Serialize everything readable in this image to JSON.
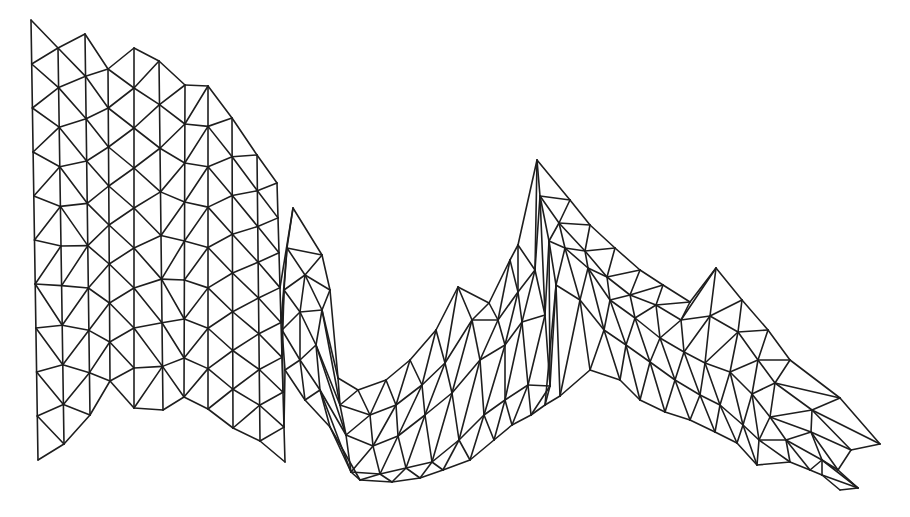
{
  "diagram": {
    "type": "triangular-finite-element-mesh",
    "background": "#ffffff",
    "line_color": "#1e1e1e",
    "left_block": {
      "description": "Regular staggered triangulated grid, vertical node columns",
      "columns": [
        {
          "x_top": 31,
          "x_bot": 38,
          "y_top": 20,
          "y_bot": 460,
          "n": 11,
          "offset": 0
        },
        {
          "x_top": 58,
          "x_bot": 64,
          "y_top": 48,
          "y_bot": 444,
          "n": 11,
          "offset": 0.5
        },
        {
          "x_top": 85,
          "x_bot": 90,
          "y_top": 34,
          "y_bot": 415,
          "n": 10,
          "offset": 0
        },
        {
          "x_top": 108,
          "x_bot": 110,
          "y_top": 69,
          "y_bot": 381,
          "n": 9,
          "offset": 0.5
        },
        {
          "x_top": 134,
          "x_bot": 134,
          "y_top": 48,
          "y_bot": 408,
          "n": 10,
          "offset": 0
        },
        {
          "x_top": 159,
          "x_bot": 163,
          "y_top": 61,
          "y_bot": 410,
          "n": 9,
          "offset": 0.5
        },
        {
          "x_top": 185,
          "x_bot": 184,
          "y_top": 85,
          "y_bot": 397,
          "n": 9,
          "offset": 0
        },
        {
          "x_top": 208,
          "x_bot": 208,
          "y_top": 86,
          "y_bot": 409,
          "n": 9,
          "offset": 0.5
        },
        {
          "x_top": 232,
          "x_bot": 233,
          "y_top": 118,
          "y_bot": 428,
          "n": 9,
          "offset": 0
        },
        {
          "x_top": 257,
          "x_bot": 260,
          "y_top": 155,
          "y_bot": 441,
          "n": 9,
          "offset": 0.5
        },
        {
          "x_top": 277,
          "x_bot": 285,
          "y_top": 183,
          "y_bot": 462,
          "n": 9,
          "offset": 0
        }
      ]
    },
    "channel_rows": {
      "description": "Curvilinear triangulated strip rows along the channel (top boundary to bottom boundary)",
      "rows": [
        [
          [
            293,
            208
          ],
          [
            322,
            255
          ],
          [
            330,
            290
          ],
          [
            338,
            378
          ],
          [
            358,
            390
          ],
          [
            386,
            380
          ],
          [
            410,
            360
          ],
          [
            436,
            330
          ],
          [
            458,
            287
          ],
          [
            489,
            303
          ],
          [
            510,
            260
          ],
          [
            518,
            245
          ],
          [
            537,
            160
          ],
          [
            570,
            200
          ],
          [
            590,
            225
          ],
          [
            615,
            248
          ],
          [
            640,
            270
          ],
          [
            663,
            285
          ],
          [
            690,
            302
          ],
          [
            716,
            268
          ],
          [
            742,
            300
          ],
          [
            768,
            330
          ],
          [
            790,
            360
          ],
          [
            840,
            398
          ],
          [
            880,
            444
          ]
        ],
        [
          [
            287,
            248
          ],
          [
            305,
            275
          ],
          [
            322,
            310
          ],
          [
            340,
            405
          ],
          [
            370,
            415
          ],
          [
            396,
            405
          ],
          [
            422,
            385
          ],
          [
            445,
            363
          ],
          [
            472,
            320
          ],
          [
            498,
            320
          ],
          [
            518,
            292
          ],
          [
            535,
            270
          ],
          [
            540,
            196
          ],
          [
            559,
            223
          ],
          [
            585,
            251
          ],
          [
            607,
            277
          ],
          [
            630,
            295
          ],
          [
            656,
            305
          ],
          [
            681,
            320
          ],
          [
            710,
            316
          ],
          [
            738,
            332
          ],
          [
            758,
            360
          ],
          [
            775,
            383
          ],
          [
            812,
            410
          ],
          [
            851,
            450
          ]
        ],
        [
          [
            284,
            290
          ],
          [
            300,
            312
          ],
          [
            316,
            345
          ],
          [
            346,
            435
          ],
          [
            373,
            446
          ],
          [
            398,
            436
          ],
          [
            425,
            415
          ],
          [
            452,
            393
          ],
          [
            480,
            360
          ],
          [
            505,
            345
          ],
          [
            522,
            322
          ],
          [
            545,
            315
          ],
          [
            549,
            241
          ],
          [
            565,
            248
          ],
          [
            588,
            268
          ],
          [
            610,
            300
          ],
          [
            635,
            318
          ],
          [
            660,
            338
          ],
          [
            684,
            352
          ],
          [
            705,
            363
          ],
          [
            730,
            372
          ],
          [
            752,
            394
          ],
          [
            770,
            417
          ],
          [
            811,
            432
          ],
          [
            838,
            470
          ]
        ],
        [
          [
            282,
            330
          ],
          [
            300,
            360
          ],
          [
            320,
            390
          ],
          [
            351,
            472
          ],
          [
            380,
            474
          ],
          [
            406,
            468
          ],
          [
            432,
            462
          ],
          [
            459,
            440
          ],
          [
            484,
            415
          ],
          [
            505,
            400
          ],
          [
            528,
            385
          ],
          [
            550,
            386
          ],
          [
            556,
            285
          ],
          [
            580,
            300
          ],
          [
            604,
            330
          ],
          [
            626,
            345
          ],
          [
            650,
            362
          ],
          [
            675,
            380
          ],
          [
            700,
            395
          ],
          [
            720,
            405
          ],
          [
            743,
            425
          ],
          [
            759,
            440
          ],
          [
            786,
            440
          ],
          [
            822,
            460
          ],
          [
            858,
            488
          ]
        ],
        [
          [
            285,
            370
          ],
          [
            305,
            400
          ],
          [
            330,
            427
          ],
          [
            360,
            480
          ],
          [
            392,
            482
          ],
          [
            420,
            478
          ],
          [
            443,
            470
          ],
          [
            470,
            460
          ],
          [
            494,
            440
          ],
          [
            512,
            425
          ],
          [
            531,
            415
          ],
          [
            545,
            405
          ],
          [
            560,
            396
          ],
          [
            590,
            370
          ],
          [
            620,
            380
          ],
          [
            640,
            400
          ],
          [
            665,
            412
          ],
          [
            690,
            420
          ],
          [
            715,
            432
          ],
          [
            737,
            443
          ],
          [
            757,
            465
          ],
          [
            790,
            462
          ],
          [
            810,
            470
          ],
          [
            822,
            475
          ],
          [
            840,
            490
          ]
        ]
      ]
    }
  }
}
